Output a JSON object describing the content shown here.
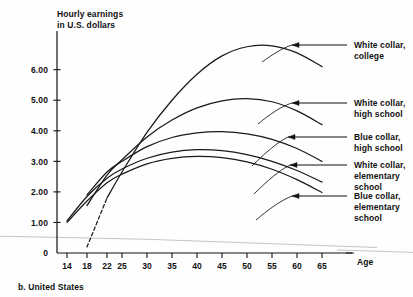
{
  "caption": "b. United States",
  "colors": {
    "ink": "#111111",
    "curve": "#1a1a1a",
    "baseline": "#bdbdbd"
  },
  "chart_data": {
    "type": "line",
    "title": "",
    "ylabel_line1": "Hourly earnings",
    "ylabel_line2": "in U.S. dollars",
    "xlabel": "Age",
    "grid": false,
    "legend_position": "right-inline-annotations",
    "xlim": [
      12,
      68
    ],
    "ylim": [
      0,
      7.2
    ],
    "xticks": [
      14,
      18,
      22,
      25,
      30,
      35,
      40,
      45,
      50,
      55,
      60,
      65
    ],
    "xtick_labels": [
      "14",
      "18",
      "22",
      "25",
      "30",
      "35",
      "40",
      "45",
      "50",
      "55",
      "60",
      "65"
    ],
    "yticks": [
      0,
      1,
      2,
      3,
      4,
      5,
      6
    ],
    "ytick_labels": [
      "0",
      "1.00",
      "2.00",
      "3.00",
      "4.00",
      "5.00",
      "6.00"
    ],
    "series": [
      {
        "name": "White collar, college",
        "label_line1": "White collar,",
        "label_line2": "college",
        "dashed_lead": true,
        "x": [
          18,
          22,
          25,
          30,
          35,
          40,
          45,
          50,
          55,
          60,
          65
        ],
        "y": [
          0.2,
          1.8,
          2.65,
          3.95,
          5.0,
          5.85,
          6.45,
          6.75,
          6.78,
          6.55,
          6.1
        ]
      },
      {
        "name": "White collar, high school",
        "label_line1": "White collar,",
        "label_line2": "high school",
        "dashed_lead": false,
        "x": [
          18,
          22,
          25,
          30,
          35,
          40,
          45,
          50,
          55,
          60,
          65
        ],
        "y": [
          1.55,
          2.55,
          3.05,
          3.8,
          4.35,
          4.75,
          4.98,
          5.05,
          4.95,
          4.65,
          4.2
        ]
      },
      {
        "name": "Blue collar, high school",
        "label_line1": "Blue collar,",
        "label_line2": "high school",
        "dashed_lead": false,
        "x": [
          18,
          22,
          25,
          30,
          35,
          40,
          45,
          50,
          55,
          60,
          65
        ],
        "y": [
          1.9,
          2.65,
          3.0,
          3.48,
          3.78,
          3.93,
          3.97,
          3.9,
          3.72,
          3.42,
          3.0
        ]
      },
      {
        "name": "White collar, elementary school",
        "label_line1": "White collar,",
        "label_line2": "elementary",
        "label_line3": "school",
        "dashed_lead": false,
        "x": [
          14,
          18,
          22,
          25,
          30,
          35,
          40,
          45,
          50,
          55,
          60,
          65
        ],
        "y": [
          1.05,
          1.85,
          2.45,
          2.75,
          3.1,
          3.3,
          3.38,
          3.35,
          3.22,
          3.0,
          2.7,
          2.32
        ]
      },
      {
        "name": "Blue collar, elementary school",
        "label_line1": "Blue collar,",
        "label_line2": "elementary",
        "label_line3": "school",
        "dashed_lead": false,
        "x": [
          14,
          18,
          22,
          25,
          30,
          35,
          40,
          45,
          50,
          55,
          60,
          65
        ],
        "y": [
          1.0,
          1.7,
          2.3,
          2.58,
          2.92,
          3.1,
          3.16,
          3.12,
          2.98,
          2.74,
          2.4,
          1.98
        ]
      }
    ],
    "annotations": [
      {
        "target_series": "White collar, college",
        "arrow_from_x": 347,
        "arrow_to_x": 292,
        "y": 45
      },
      {
        "target_series": "White collar, high school",
        "arrow_from_x": 347,
        "arrow_to_x": 292,
        "y": 103
      },
      {
        "target_series": "Blue collar, high school",
        "arrow_from_x": 347,
        "arrow_to_x": 288,
        "y": 137
      },
      {
        "target_series": "White collar, elementary school",
        "arrow_from_x": 347,
        "arrow_to_x": 290,
        "y": 165
      },
      {
        "target_series": "Blue collar, elementary school",
        "arrow_from_x": 347,
        "arrow_to_x": 292,
        "y": 196
      }
    ]
  }
}
